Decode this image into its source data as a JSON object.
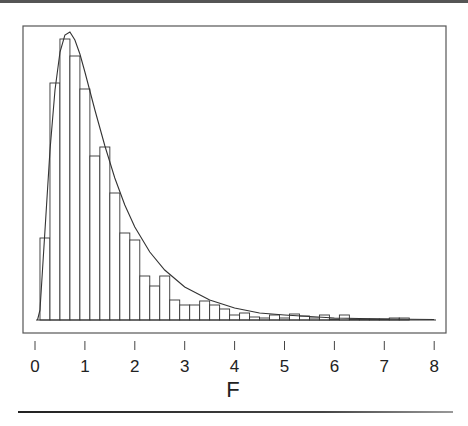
{
  "chart_data": {
    "type": "bar",
    "subtype": "histogram_with_density_curve",
    "title": "",
    "xlabel": "F",
    "ylabel": "",
    "xlim": [
      0,
      8
    ],
    "x_ticks": [
      0,
      1,
      2,
      3,
      4,
      5,
      6,
      7,
      8
    ],
    "x_tick_labels": [
      "0",
      "1",
      "2",
      "3",
      "4",
      "5",
      "6",
      "7",
      "8"
    ],
    "y_axis_shown": false,
    "grid": false,
    "legend": null,
    "bin_width": 0.2,
    "bins_start": [
      0.1,
      0.3,
      0.5,
      0.7,
      0.9,
      1.1,
      1.3,
      1.5,
      1.7,
      1.9,
      2.1,
      2.3,
      2.5,
      2.7,
      2.9,
      3.1,
      3.3,
      3.5,
      3.7,
      3.9,
      4.1,
      4.3,
      4.5,
      4.7,
      4.9,
      5.1,
      5.3,
      5.5,
      5.7,
      5.9,
      6.1,
      6.3,
      6.5,
      6.7,
      6.9,
      7.1,
      7.3
    ],
    "values_relative": [
      82,
      237,
      281,
      264,
      231,
      164,
      173,
      127,
      87,
      80,
      44,
      34,
      44,
      20,
      15,
      15,
      19,
      15,
      11,
      5,
      7,
      3,
      2,
      5,
      2,
      6,
      4,
      2,
      5,
      1,
      5,
      1,
      1,
      1,
      1,
      2,
      2
    ],
    "curve": {
      "name": "F density",
      "description": "Smooth right-skewed F-distribution density overlaid on histogram, peak near F≈0.65",
      "points": [
        [
          0.05,
          0
        ],
        [
          0.1,
          10
        ],
        [
          0.2,
          90
        ],
        [
          0.3,
          170
        ],
        [
          0.4,
          230
        ],
        [
          0.5,
          268
        ],
        [
          0.6,
          285
        ],
        [
          0.7,
          288
        ],
        [
          0.8,
          280
        ],
        [
          0.9,
          266
        ],
        [
          1.0,
          248
        ],
        [
          1.2,
          210
        ],
        [
          1.4,
          174
        ],
        [
          1.6,
          142
        ],
        [
          1.8,
          115
        ],
        [
          2.0,
          93
        ],
        [
          2.3,
          68
        ],
        [
          2.6,
          50
        ],
        [
          3.0,
          33
        ],
        [
          3.5,
          20
        ],
        [
          4.0,
          12
        ],
        [
          4.5,
          7
        ],
        [
          5.0,
          5
        ],
        [
          6.0,
          2
        ],
        [
          7.0,
          1
        ],
        [
          8.0,
          0.5
        ]
      ]
    },
    "colors": {
      "bars_fill": "#ffffff",
      "bars_stroke": "#333333",
      "curve": "#333333",
      "frame": "#555555"
    }
  },
  "axis": {
    "xlabel": "F"
  }
}
